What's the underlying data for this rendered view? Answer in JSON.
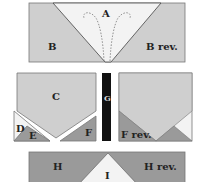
{
  "diagram": {
    "colors": {
      "light": "#f3f3f3",
      "medium": "#cfcfcf",
      "dark": "#9a9a9a",
      "black": "#111111",
      "outline": "#555555"
    },
    "top_unit": {
      "labels": {
        "a": "A",
        "b": "B",
        "b_rev": "B rev."
      }
    },
    "middle_left_unit": {
      "labels": {
        "c": "C",
        "d": "D",
        "e": "E",
        "f": "F"
      }
    },
    "strip": {
      "label": "G"
    },
    "middle_right_unit": {
      "labels": {
        "f_rev": "F rev."
      }
    },
    "bottom_unit": {
      "labels": {
        "h": "H",
        "h_rev": "H rev.",
        "i": "I"
      }
    }
  }
}
